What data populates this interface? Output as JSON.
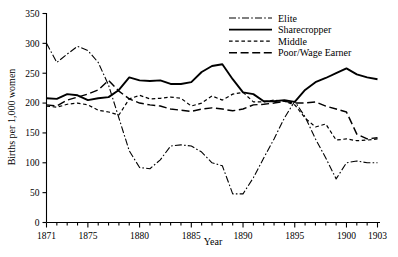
{
  "chart_data": {
    "type": "line",
    "title": "",
    "xlabel": "Year",
    "ylabel": "Births per 1,000 women",
    "xlim": [
      1871,
      1903
    ],
    "ylim": [
      0,
      350
    ],
    "ytick_step": 50,
    "yticks": [
      0,
      50,
      100,
      150,
      200,
      250,
      300,
      350
    ],
    "xticks_labeled": [
      1871,
      1875,
      1880,
      1885,
      1890,
      1895,
      1900,
      1903
    ],
    "xticks_minor_every": 1,
    "grid": false,
    "legend_position": "top-right",
    "x": [
      1871,
      1872,
      1873,
      1874,
      1875,
      1876,
      1877,
      1878,
      1879,
      1880,
      1881,
      1882,
      1883,
      1884,
      1885,
      1886,
      1887,
      1888,
      1889,
      1890,
      1891,
      1892,
      1893,
      1894,
      1895,
      1896,
      1897,
      1898,
      1899,
      1900,
      1901,
      1902,
      1903
    ],
    "series": [
      {
        "name": "Elite",
        "style": "dash-dot",
        "values": [
          300,
          268,
          282,
          295,
          288,
          268,
          230,
          175,
          120,
          92,
          90,
          105,
          128,
          130,
          128,
          118,
          100,
          95,
          48,
          48,
          75,
          108,
          140,
          175,
          203,
          177,
          140,
          108,
          73,
          100,
          103,
          100,
          100
        ]
      },
      {
        "name": "Sharecropper",
        "style": "solid",
        "values": [
          208,
          207,
          215,
          213,
          205,
          208,
          210,
          222,
          243,
          238,
          237,
          238,
          232,
          232,
          235,
          252,
          262,
          265,
          240,
          218,
          215,
          203,
          203,
          205,
          202,
          222,
          235,
          242,
          250,
          258,
          248,
          243,
          240
        ]
      },
      {
        "name": "Middle",
        "style": "short-dash",
        "values": [
          195,
          193,
          198,
          200,
          197,
          188,
          185,
          180,
          207,
          213,
          207,
          208,
          210,
          208,
          195,
          200,
          212,
          205,
          215,
          218,
          202,
          202,
          205,
          203,
          197,
          175,
          160,
          165,
          138,
          140,
          137,
          138,
          140
        ]
      },
      {
        "name": "Poor/Wage Earner",
        "style": "long-dash",
        "values": [
          197,
          195,
          205,
          210,
          215,
          222,
          238,
          220,
          207,
          200,
          197,
          195,
          190,
          188,
          186,
          190,
          192,
          190,
          187,
          190,
          197,
          198,
          200,
          203,
          200,
          200,
          202,
          195,
          190,
          185,
          148,
          140,
          142
        ]
      }
    ]
  },
  "legend": {
    "items": [
      {
        "label": "Elite",
        "style": "dash-dot"
      },
      {
        "label": "Sharecropper",
        "style": "solid"
      },
      {
        "label": "Middle",
        "style": "short-dash"
      },
      {
        "label": "Poor/Wage Earner",
        "style": "long-dash"
      }
    ]
  },
  "axes": {
    "y_label": "Births per 1,000 women",
    "x_label": "Year",
    "y_tick_labels": [
      "0",
      "50",
      "100",
      "150",
      "200",
      "250",
      "300",
      "350"
    ],
    "x_tick_labels": [
      "1871",
      "1875",
      "1880",
      "1885",
      "1890",
      "1895",
      "1900",
      "1903"
    ]
  }
}
